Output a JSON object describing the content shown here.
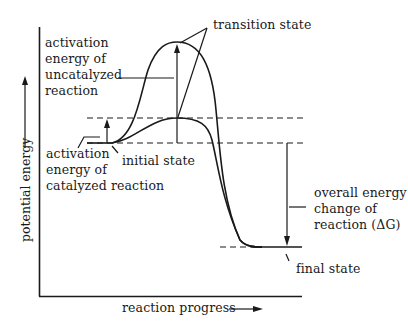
{
  "diagram": {
    "type": "energy-profile",
    "axes": {
      "y_label": "potential energy",
      "x_label": "reaction progress"
    },
    "labels": {
      "transition_state": "transition state",
      "uncatalyzed_activation": [
        "activation",
        "energy of",
        "uncatalyzed",
        "reaction"
      ],
      "catalyzed_activation": [
        "activation",
        "energy of",
        "catalyzed reaction"
      ],
      "initial_state": "initial state",
      "overall_change": [
        "overall energy",
        "change of",
        "reaction (ΔG)"
      ],
      "final_state": "final state"
    },
    "levels": {
      "initial_state_y": 143,
      "catalyzed_peak_y": 118,
      "uncatalyzed_peak_y": 42,
      "final_state_y": 247
    },
    "colors": {
      "ink": "#1a1a1a",
      "background": "#ffffff"
    }
  }
}
